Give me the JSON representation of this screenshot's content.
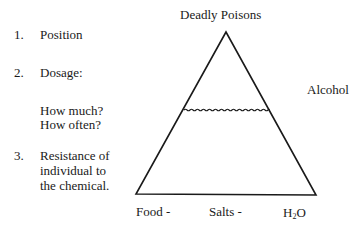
{
  "list": {
    "items": [
      {
        "number": "1.",
        "lines": [
          "Position"
        ]
      },
      {
        "number": "2.",
        "lines": [
          "Dosage:"
        ],
        "sub_lines": [
          "How much?",
          "How often?"
        ]
      },
      {
        "number": "3.",
        "lines": [
          "Resistance of",
          "individual to",
          "the chemical."
        ]
      }
    ]
  },
  "diagram": {
    "apex_label": "Deadly Poisons",
    "side_label": "Alcohol",
    "base_labels": [
      "Food -",
      "Salts -"
    ],
    "water_label": {
      "main": "H",
      "subscript": "2",
      "tail": "O"
    }
  }
}
